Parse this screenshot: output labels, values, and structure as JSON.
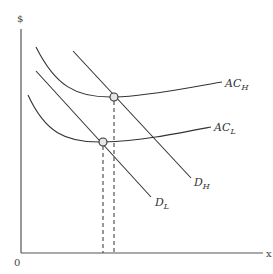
{
  "diagram": {
    "type": "economics-cost-demand",
    "y_axis_label": "$",
    "x_axis_label": "x",
    "origin_label": "0",
    "curves": [
      {
        "id": "ac_h",
        "kind": "average-cost",
        "label_main": "AC",
        "label_sub": "H"
      },
      {
        "id": "ac_l",
        "kind": "average-cost",
        "label_main": "AC",
        "label_sub": "L"
      },
      {
        "id": "d_h",
        "kind": "demand",
        "label_main": "D",
        "label_sub": "H"
      },
      {
        "id": "d_l",
        "kind": "demand",
        "label_main": "D",
        "label_sub": "L"
      }
    ],
    "equilibria": [
      {
        "id": "eq_h",
        "description": "D_H tangent-intersection with AC_H",
        "dropline": "dashed"
      },
      {
        "id": "eq_l",
        "description": "D_L intersection with AC_L",
        "dropline": "dashed"
      }
    ]
  }
}
